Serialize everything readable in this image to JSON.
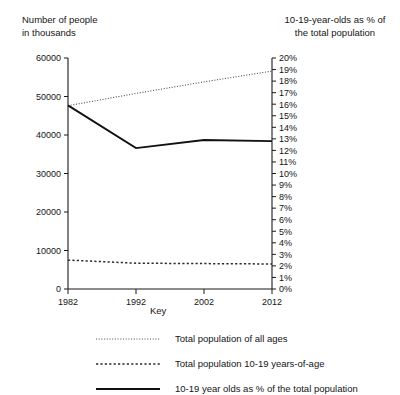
{
  "chart": {
    "left_axis_title": "Number of people\nin thousands",
    "right_axis_title": "10-19-year-olds as % of\nthe total population",
    "key_title": "Key"
  },
  "chart_data": {
    "type": "line",
    "title": "",
    "xlabel": "",
    "ylabel": "Number of people in thousands",
    "y2label": "10-19-year-olds as % of the total population",
    "grid": false,
    "legend_position": "bottom",
    "x": [
      1982,
      1992,
      2002,
      2012
    ],
    "xticklabels": [
      "1982",
      "1992",
      "2002",
      "2012"
    ],
    "ylim": [
      0,
      60000
    ],
    "yticks": [
      0,
      10000,
      20000,
      30000,
      40000,
      50000,
      60000
    ],
    "yticklabels": [
      "0",
      "10000",
      "20000",
      "30000",
      "40000",
      "50000",
      "60000"
    ],
    "y2lim": [
      0,
      20
    ],
    "y2ticks": [
      0,
      1,
      2,
      3,
      4,
      5,
      6,
      7,
      8,
      9,
      10,
      11,
      12,
      13,
      14,
      15,
      16,
      17,
      18,
      19,
      20
    ],
    "y2ticklabels": [
      "0%",
      "1%",
      "2%",
      "3%",
      "4%",
      "5%",
      "6%",
      "7%",
      "8%",
      "9%",
      "10%",
      "11%",
      "12%",
      "13%",
      "14%",
      "15%",
      "16%",
      "17%",
      "18%",
      "19%",
      "20%"
    ],
    "series": [
      {
        "name": "Total population of all ages",
        "axis": "left",
        "style": "dotted",
        "values": [
          47600,
          50800,
          53800,
          56600
        ]
      },
      {
        "name": "Total population 10-19 years-of-age",
        "axis": "left",
        "style": "dashed",
        "values": [
          7500,
          6700,
          6600,
          6500
        ]
      },
      {
        "name": "10-19 year olds as % of the total population",
        "axis": "right",
        "style": "solid",
        "values": [
          15.9,
          12.2,
          12.9,
          12.8
        ]
      }
    ],
    "legend": [
      "Total population of all ages",
      "Total population 10-19 years-of-age",
      "10-19 year olds as % of the total population"
    ]
  }
}
